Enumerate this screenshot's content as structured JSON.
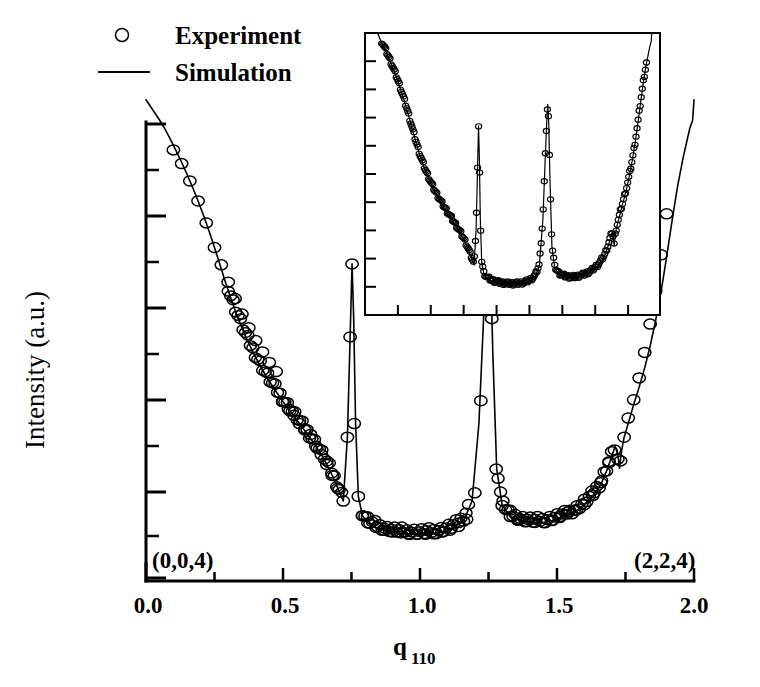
{
  "figure": {
    "title": "",
    "background": "#ffffff",
    "ink_color": "#000000"
  },
  "legend": {
    "position": "top-left",
    "entries": [
      {
        "label": "Experiment",
        "marker": "open-circle"
      },
      {
        "label": "Simulation",
        "marker": "solid-line"
      }
    ]
  },
  "axes": {
    "x": {
      "label_main": "q",
      "label_sub": "110",
      "tick_labels": [
        "0.0",
        "0.5",
        "1.0",
        "1.5",
        "2.0"
      ],
      "tick_values": [
        0.0,
        0.5,
        1.0,
        1.5,
        2.0
      ],
      "minor_tick_values": [
        0.25,
        0.75,
        1.25,
        1.75
      ],
      "range": [
        0.0,
        2.0
      ]
    },
    "y": {
      "label": "Intensity (a.u.)",
      "tick_labels": [],
      "scale": "log",
      "major_tick_count": 6,
      "minor_tick_count": 6
    }
  },
  "annotations": [
    {
      "name": "left-bragg-label",
      "text": "(0,0,4)",
      "x": 0.06,
      "y_px": 562
    },
    {
      "name": "right-bragg-label",
      "text": "(2,2,4)",
      "x": 1.72,
      "y_px": 562
    }
  ],
  "inset": {
    "present": true,
    "has_axis_labels": false,
    "x_tick_count": 8,
    "y_tick_count": 9,
    "description": "compressed-range duplicate of main truncation-rod scan"
  },
  "chart_data": {
    "type": "line",
    "title": "",
    "xlabel": "q110",
    "ylabel": "Intensity (a.u.)",
    "xlim": [
      0.0,
      2.0
    ],
    "ylim_log": true,
    "grid": false,
    "legend_position": "top-left",
    "annotations": [
      "(0,0,4)",
      "(2,2,4)"
    ],
    "series": [
      {
        "name": "Simulation",
        "style": "line",
        "x": [
          0.05,
          0.07,
          0.09,
          0.11,
          0.13,
          0.15,
          0.17,
          0.19,
          0.21,
          0.23,
          0.25,
          0.27,
          0.29,
          0.31,
          0.33,
          0.35,
          0.37,
          0.39,
          0.41,
          0.44,
          0.47,
          0.5,
          0.53,
          0.56,
          0.59,
          0.62,
          0.65,
          0.68,
          0.7,
          0.72,
          0.735,
          0.745,
          0.752,
          0.758,
          0.765,
          0.775,
          0.79,
          0.81,
          0.84,
          0.88,
          0.92,
          0.96,
          1.0,
          1.04,
          1.08,
          1.12,
          1.16,
          1.19,
          1.215,
          1.232,
          1.243,
          1.25,
          1.257,
          1.266,
          1.28,
          1.3,
          1.33,
          1.37,
          1.41,
          1.45,
          1.49,
          1.53,
          1.57,
          1.6,
          1.63,
          1.66,
          1.685,
          1.7,
          1.712,
          1.722,
          1.728,
          1.735,
          1.745,
          1.76,
          1.78,
          1.8,
          1.82,
          1.84,
          1.86,
          1.88,
          1.9,
          1.92,
          1.94,
          1.96,
          1.975,
          1.985,
          1.995
        ],
        "y": [
          0.995,
          0.975,
          0.952,
          0.928,
          0.903,
          0.876,
          0.848,
          0.818,
          0.786,
          0.752,
          0.716,
          0.678,
          0.64,
          0.604,
          0.57,
          0.54,
          0.512,
          0.487,
          0.464,
          0.432,
          0.404,
          0.378,
          0.354,
          0.33,
          0.306,
          0.28,
          0.252,
          0.216,
          0.188,
          0.16,
          0.3,
          0.52,
          0.68,
          0.56,
          0.33,
          0.17,
          0.128,
          0.112,
          0.102,
          0.094,
          0.09,
          0.088,
          0.087,
          0.088,
          0.092,
          0.1,
          0.118,
          0.16,
          0.33,
          0.56,
          0.7,
          0.76,
          0.69,
          0.48,
          0.23,
          0.15,
          0.126,
          0.116,
          0.112,
          0.113,
          0.118,
          0.126,
          0.138,
          0.152,
          0.17,
          0.196,
          0.232,
          0.258,
          0.28,
          0.262,
          0.232,
          0.268,
          0.3,
          0.33,
          0.372,
          0.41,
          0.452,
          0.5,
          0.556,
          0.62,
          0.695,
          0.775,
          0.85,
          0.912,
          0.952,
          0.978,
          0.995
        ]
      },
      {
        "name": "Experiment",
        "style": "open-circle",
        "x": [
          0.1,
          0.13,
          0.16,
          0.19,
          0.22,
          0.25,
          0.275,
          0.3,
          0.325,
          0.35,
          0.375,
          0.4,
          0.425,
          0.45,
          0.475,
          0.5,
          0.52,
          0.54,
          0.56,
          0.58,
          0.6,
          0.62,
          0.64,
          0.66,
          0.68,
          0.7,
          0.72,
          0.735,
          0.745,
          0.752,
          0.76,
          0.775,
          0.79,
          0.81,
          0.84,
          0.87,
          0.9,
          0.93,
          0.96,
          0.99,
          1.02,
          1.05,
          1.08,
          1.11,
          1.14,
          1.17,
          1.2,
          1.222,
          1.238,
          1.25,
          1.262,
          1.278,
          1.3,
          1.33,
          1.36,
          1.39,
          1.42,
          1.45,
          1.48,
          1.51,
          1.54,
          1.57,
          1.6,
          1.63,
          1.66,
          1.69,
          1.71,
          1.722,
          1.732,
          1.745,
          1.76,
          1.78,
          1.8,
          1.82,
          1.84,
          1.86,
          1.88,
          1.9
        ],
        "y": [
          0.93,
          0.9,
          0.862,
          0.818,
          0.77,
          0.716,
          0.678,
          0.64,
          0.604,
          0.57,
          0.54,
          0.512,
          0.487,
          0.464,
          0.444,
          0.378,
          0.362,
          0.348,
          0.33,
          0.316,
          0.306,
          0.28,
          0.262,
          0.24,
          0.216,
          0.188,
          0.16,
          0.3,
          0.52,
          0.68,
          0.33,
          0.17,
          0.128,
          0.112,
          0.102,
          0.096,
          0.092,
          0.09,
          0.088,
          0.087,
          0.087,
          0.088,
          0.092,
          0.096,
          0.104,
          0.12,
          0.178,
          0.38,
          0.6,
          0.76,
          0.56,
          0.23,
          0.15,
          0.126,
          0.12,
          0.115,
          0.113,
          0.113,
          0.118,
          0.126,
          0.136,
          0.14,
          0.152,
          0.172,
          0.2,
          0.244,
          0.272,
          0.252,
          0.248,
          0.3,
          0.342,
          0.382,
          0.43,
          0.486,
          0.548,
          0.62,
          0.7,
          0.79
        ]
      }
    ],
    "peaks": [
      {
        "name": "bragg-004",
        "position": 0.0,
        "label": "(0,0,4)"
      },
      {
        "name": "superstructure-peak-1",
        "position": 0.75,
        "relative_height": 0.68
      },
      {
        "name": "superstructure-peak-2",
        "position": 1.25,
        "relative_height": 0.76
      },
      {
        "name": "shoulder-notch",
        "position": 1.72,
        "relative_height": 0.28
      },
      {
        "name": "bragg-224",
        "position": 2.0,
        "label": "(2,2,4)"
      }
    ]
  }
}
